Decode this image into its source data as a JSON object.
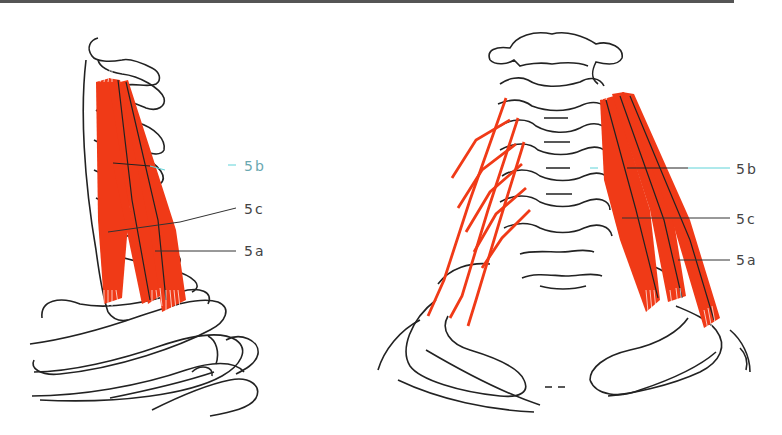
{
  "figure": {
    "colors": {
      "muscle": "#f03a17",
      "outline": "#222222",
      "leader": "#333333",
      "leader_accent": "#5fd3d8"
    },
    "left_view": {
      "name": "lateral view of cervical spine with scalene muscles",
      "labels": [
        {
          "id": "5b",
          "text": "5b"
        },
        {
          "id": "5c",
          "text": "5c"
        },
        {
          "id": "5a",
          "text": "5a"
        }
      ]
    },
    "right_view": {
      "name": "anterior view of cervical spine with scalene muscles",
      "labels": [
        {
          "id": "5b",
          "text": "5b"
        },
        {
          "id": "5c",
          "text": "5c"
        },
        {
          "id": "5a",
          "text": "5a"
        }
      ]
    }
  }
}
